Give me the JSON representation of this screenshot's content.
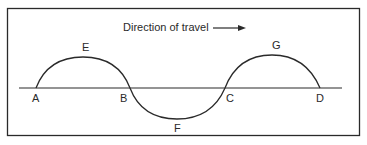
{
  "diagram": {
    "title": "Direction of travel",
    "arrow": "direction-arrow-right",
    "colors": {
      "stroke": "#2a2a2a",
      "background": "#ffffff"
    },
    "points": [
      {
        "label": "A",
        "position": "baseline start"
      },
      {
        "label": "B",
        "position": "baseline crossing"
      },
      {
        "label": "C",
        "position": "baseline crossing"
      },
      {
        "label": "D",
        "position": "baseline end"
      },
      {
        "label": "E",
        "position": "crest between A and B"
      },
      {
        "label": "F",
        "position": "trough between B and C"
      },
      {
        "label": "G",
        "position": "crest between C and D"
      }
    ],
    "labels": {
      "A": "A",
      "B": "B",
      "C": "C",
      "D": "D",
      "E": "E",
      "F": "F",
      "G": "G"
    }
  }
}
